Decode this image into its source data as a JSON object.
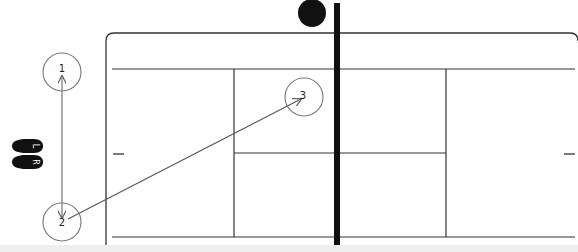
{
  "diagram": {
    "type": "tennis-court-movement-drill",
    "colors": {
      "line": "#333333",
      "net": "#111111",
      "ball": "#111111",
      "marker_stroke": "#777777",
      "arrow": "#666666",
      "background": "#ffffff",
      "bottom_band": "#eeeeee"
    },
    "feet_legend": {
      "left_label": "L",
      "right_label": "R"
    },
    "markers": [
      {
        "id": 1,
        "label": "1",
        "cx": 62,
        "cy": 72
      },
      {
        "id": 2,
        "label": "2",
        "cx": 62,
        "cy": 222
      },
      {
        "id": 3,
        "label": "3",
        "cx": 304,
        "cy": 97
      }
    ],
    "arrows": [
      {
        "from": "1",
        "to": "2",
        "bidirectional": true
      },
      {
        "from": "2",
        "to": "3",
        "bidirectional": false
      }
    ],
    "ball": {
      "cx": 312,
      "cy": 13,
      "r": 14
    },
    "net": {
      "x": 337,
      "y1": 3,
      "y2": 245,
      "width": 6
    }
  }
}
